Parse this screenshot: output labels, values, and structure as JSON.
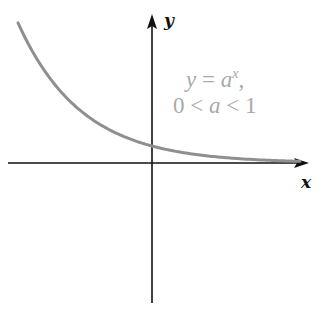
{
  "diagram": {
    "type": "function-graph",
    "function": "exponential decay",
    "axes": {
      "x_label": "x",
      "y_label": "y",
      "origin_px": [
        152,
        163
      ],
      "x_range_px": [
        8,
        309
      ],
      "y_range_px": [
        14,
        303
      ]
    },
    "annotation": {
      "line1_var": "y",
      "line1_eq": " = ",
      "line1_base": "a",
      "line1_exp": "x",
      "line1_comma": ",",
      "line2_left": "0 < ",
      "line2_var": "a",
      "line2_right": " < 1"
    },
    "colors": {
      "curve": "#8f8f8f",
      "axes": "#111111",
      "annotation": "#a9a9a9"
    }
  }
}
